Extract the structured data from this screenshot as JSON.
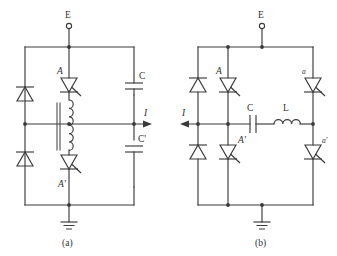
{
  "figure": {
    "title": "",
    "background_color": "#ffffff",
    "line_color": "#3a3a3a",
    "text_color": "#2f2f2f",
    "width": 337,
    "height": 256
  },
  "subfigures": [
    {
      "id": "a",
      "caption": "(a)",
      "supply_terminal_label": "E",
      "current_label": "I",
      "current_direction": "right",
      "components": [
        {
          "name": "diode-upper-left",
          "label": "",
          "type": "diode",
          "orientation": "up"
        },
        {
          "name": "diode-lower-left",
          "label": "",
          "type": "diode",
          "orientation": "up"
        },
        {
          "name": "thyristor-A",
          "label": "A",
          "type": "thyristor",
          "orientation": "down"
        },
        {
          "name": "thyristor-A-prime",
          "label": "A'",
          "type": "thyristor",
          "orientation": "down"
        },
        {
          "name": "capacitor-C",
          "label": "C",
          "type": "capacitor"
        },
        {
          "name": "capacitor-C-prime",
          "label": "C'",
          "type": "capacitor"
        },
        {
          "name": "coupled-inductor",
          "label": "",
          "type": "coupled-inductor"
        },
        {
          "name": "ground",
          "label": "",
          "type": "ground"
        }
      ]
    },
    {
      "id": "b",
      "caption": "(b)",
      "supply_terminal_label": "E",
      "current_label": "I",
      "current_direction": "left",
      "components": [
        {
          "name": "diode-upper-left",
          "label": "",
          "type": "diode",
          "orientation": "up"
        },
        {
          "name": "diode-lower-left",
          "label": "",
          "type": "diode",
          "orientation": "up"
        },
        {
          "name": "thyristor-A",
          "label": "A",
          "type": "thyristor",
          "orientation": "down"
        },
        {
          "name": "thyristor-A-prime",
          "label": "A'",
          "type": "thyristor",
          "orientation": "down"
        },
        {
          "name": "thyristor-a",
          "label": "a",
          "type": "thyristor",
          "orientation": "down"
        },
        {
          "name": "thyristor-a-prime",
          "label": "a'",
          "type": "thyristor",
          "orientation": "down"
        },
        {
          "name": "capacitor-C",
          "label": "C",
          "type": "capacitor"
        },
        {
          "name": "inductor-L",
          "label": "L",
          "type": "inductor"
        },
        {
          "name": "ground",
          "label": "",
          "type": "ground"
        }
      ]
    }
  ],
  "labels": {
    "E": "E",
    "I": "I",
    "A": "A",
    "A_prime": "A'",
    "a": "a",
    "a_prime": "a'",
    "C": "C",
    "C_prime": "C'",
    "L": "L",
    "caption_a": "(a)",
    "caption_b": "(b)"
  }
}
